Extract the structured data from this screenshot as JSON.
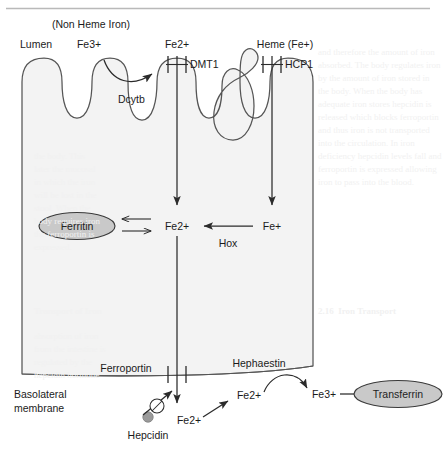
{
  "figure": {
    "title_rule": "top-horizontal-rule",
    "colors": {
      "cell_fill": "#f3f3f3",
      "cell_stroke": "#555555",
      "organelle_fill": "#c9c9c9",
      "organelle_stroke": "#3a3a3a",
      "hepcidin_fill": "#9a9a9a",
      "arrow": "#2b2b2b",
      "text": "#1b1b1b",
      "rule": "#b9b9b9",
      "ghost": "#f1f1f1"
    }
  },
  "labels": {
    "non_heme_iron": "(Non Heme Iron)",
    "lumen": "Lumen",
    "fe3_apical": "Fe3+",
    "fe2_apical": "Fe2+",
    "heme": "Heme (Fe+)",
    "dmt1": "DMT1",
    "hcp1": "HCP1",
    "dcytb": "Dcytb",
    "ferritin": "Ferritin",
    "fe2_cytosol": "Fe2+",
    "fe_plus_cytosol": "Fe+",
    "hox": "Hox",
    "ferroportin": "Ferroportin",
    "hephaestin": "Hephaestin",
    "basolateral_line1": "Basolateral",
    "basolateral_line2": "membrane",
    "fe2_exported": "Fe2+",
    "fe2_basal": "Fe2+",
    "fe3_basal": "Fe3+",
    "transferrin": "Transferrin",
    "hepcidin": "Hepcidin"
  },
  "ghost_page_text": {
    "block_right_top": "and therefore the amount of iron\nabsorbed. The body regulates iron\nby the amount of iron stored in\nthe body. When the body has\nadequate iron stores hepcidin is\nreleased which blocks ferroportin\nand thus iron is not transported\ninto the circulation. In iron\ndeficiency hepcidin levels fall and\nferroportin is expressed allowing\niron to pass into the blood.",
    "block_left_mid": "the body. This\nlater the mucosal\nin which the iron\nwill be lost in the\nstool. When the\nbody requires iron\nthe ferroportin is\nexpressed.",
    "block_left_caption": "Transport of Iron",
    "block_right_caption": "2.16  Iron Transport",
    "block_left_low": "absorption of iron\nfrom the intestine is\nregulated by the\nhepcidin hormone"
  },
  "geometry": {
    "cell_left_x": 22,
    "cell_right_x": 313,
    "cell_top_y": 62,
    "cell_bottom_y": 375,
    "dmt1_channel_x": 177,
    "hcp1_channel_x": 272,
    "ferroportin_channel_x": 177
  },
  "icon_names": [
    "ferritin-ellipse-icon",
    "transferrin-ellipse-icon",
    "hepcidin-dot-icon",
    "inhibition-circle-slash-icon",
    "dmt1-channel-icon",
    "hcp1-channel-icon",
    "ferroportin-channel-icon",
    "arrow-icon"
  ]
}
